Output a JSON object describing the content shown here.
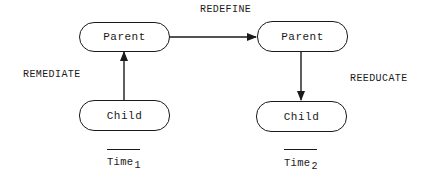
{
  "diagram": {
    "nodes": {
      "parent_t1": {
        "label": "Parent"
      },
      "child_t1": {
        "label": "Child"
      },
      "parent_t2": {
        "label": "Parent"
      },
      "child_t2": {
        "label": "Child"
      }
    },
    "edges": {
      "redefine": {
        "label": "REDEFINE",
        "from": "parent_t1",
        "to": "parent_t2"
      },
      "remediate": {
        "label": "REMEDIATE",
        "from": "child_t1",
        "to": "parent_t1"
      },
      "reeducate": {
        "label": "REEDUCATE",
        "from": "parent_t2",
        "to": "child_t2"
      }
    },
    "time_axis": {
      "t1": {
        "label": "Time",
        "subscript": "1"
      },
      "t2": {
        "label": "Time",
        "subscript": "2"
      }
    },
    "colors": {
      "stroke": "#1a1a1a",
      "background": "#ffffff"
    }
  }
}
